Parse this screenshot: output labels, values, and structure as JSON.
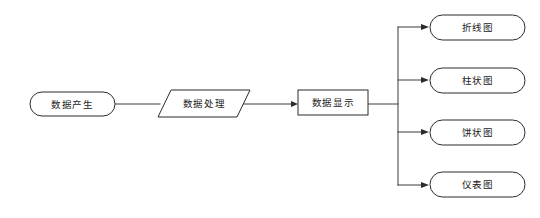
{
  "diagram": {
    "type": "flowchart",
    "orientation": "left-to-right",
    "background_color": "#ffffff",
    "stroke_color": "#2b2b2b",
    "text_color": "#1a1a1a",
    "nodes": [
      {
        "id": "data-generation",
        "label": "数据产生",
        "shape": "stadium",
        "x": 30,
        "y": 92,
        "w": 85,
        "h": 24
      },
      {
        "id": "data-processing",
        "label": "数据处理",
        "shape": "parallelogram",
        "x": 158,
        "y": 90,
        "w": 92,
        "h": 27
      },
      {
        "id": "data-display",
        "label": "数据显示",
        "shape": "rectangle",
        "x": 298,
        "y": 90,
        "w": 70,
        "h": 25
      },
      {
        "id": "line-chart",
        "label": "折线图",
        "shape": "stadium",
        "x": 430,
        "y": 15,
        "w": 95,
        "h": 25
      },
      {
        "id": "bar-chart",
        "label": "柱状图",
        "shape": "stadium",
        "x": 430,
        "y": 68,
        "w": 95,
        "h": 25
      },
      {
        "id": "pie-chart",
        "label": "饼状图",
        "shape": "stadium",
        "x": 430,
        "y": 120,
        "w": 95,
        "h": 25
      },
      {
        "id": "gauge-chart",
        "label": "仪表图",
        "shape": "stadium",
        "x": 430,
        "y": 172,
        "w": 95,
        "h": 25
      }
    ],
    "edges": [
      {
        "id": "edge-generation-processing",
        "from": "data-generation",
        "to": "data-processing",
        "arrowhead": false
      },
      {
        "id": "edge-processing-display",
        "from": "data-processing",
        "to": "data-display",
        "arrowhead": true
      },
      {
        "id": "edge-display-line",
        "from": "data-display",
        "to": "line-chart",
        "arrowhead": true
      },
      {
        "id": "edge-display-bar",
        "from": "data-display",
        "to": "bar-chart",
        "arrowhead": true
      },
      {
        "id": "edge-display-pie",
        "from": "data-display",
        "to": "pie-chart",
        "arrowhead": true
      },
      {
        "id": "edge-display-gauge",
        "from": "data-display",
        "to": "gauge-chart",
        "arrowhead": true
      }
    ],
    "trunk": {
      "x": 398,
      "y_top": 27,
      "y_bottom": 185
    }
  }
}
